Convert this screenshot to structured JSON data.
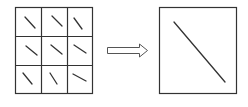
{
  "diagram": {
    "colors": {
      "stroke": "#333333",
      "background": "#ffffff"
    },
    "grid": {
      "rows": 3,
      "cols": 3,
      "cells": [
        {
          "row": 0,
          "col": 0,
          "segment": [
            25,
            17,
            35,
            28
          ]
        },
        {
          "row": 0,
          "col": 1,
          "segment": [
            52,
            16,
            62,
            26
          ]
        },
        {
          "row": 0,
          "col": 2,
          "segment": [
            74,
            18,
            82,
            29
          ]
        },
        {
          "row": 1,
          "col": 0,
          "segment": [
            26,
            46,
            37,
            55
          ]
        },
        {
          "row": 1,
          "col": 1,
          "segment": [
            51,
            45,
            62,
            54
          ]
        },
        {
          "row": 1,
          "col": 2,
          "segment": [
            74,
            45,
            86,
            53
          ]
        },
        {
          "row": 2,
          "col": 0,
          "segment": [
            23,
            73,
            32,
            84
          ]
        },
        {
          "row": 2,
          "col": 1,
          "segment": [
            50,
            73,
            57,
            84
          ]
        },
        {
          "row": 2,
          "col": 2,
          "segment": [
            73,
            74,
            86,
            81
          ]
        }
      ]
    },
    "arrow": {
      "direction": "right",
      "style": "hollow"
    },
    "result_box": {
      "line": [
        174,
        22,
        225,
        82
      ]
    }
  }
}
